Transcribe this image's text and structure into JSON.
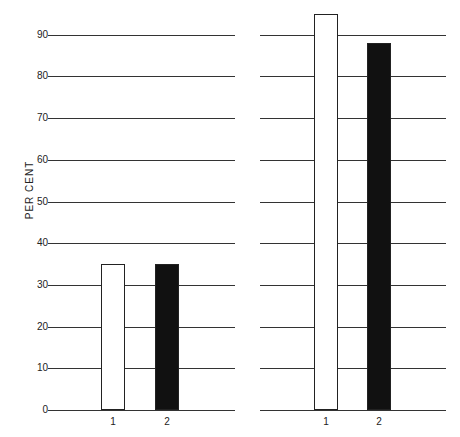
{
  "chart_data": [
    {
      "type": "bar",
      "panel": "left",
      "categories": [
        "1",
        "2"
      ],
      "values": [
        35,
        35
      ],
      "bar_fills": [
        "#ffffff",
        "#111111"
      ],
      "title": "",
      "xlabel": "",
      "ylabel": "PER CENT",
      "ylim": [
        0,
        95
      ],
      "yticks": [
        0,
        10,
        20,
        30,
        40,
        50,
        60,
        70,
        80,
        90
      ],
      "grid": true
    },
    {
      "type": "bar",
      "panel": "right",
      "categories": [
        "1",
        "2"
      ],
      "values": [
        95,
        88
      ],
      "bar_fills": [
        "#ffffff",
        "#111111"
      ],
      "title": "",
      "xlabel": "",
      "ylabel": "",
      "ylim": [
        0,
        95
      ],
      "yticks": [
        0,
        10,
        20,
        30,
        40,
        50,
        60,
        70,
        80,
        90
      ],
      "grid": true
    }
  ],
  "axis": {
    "ylabel": "PER CENT",
    "ticks": [
      "0",
      "10",
      "20",
      "30",
      "40",
      "50",
      "60",
      "70",
      "80",
      "90"
    ]
  },
  "left": {
    "x_labels": [
      "1",
      "2"
    ]
  },
  "right": {
    "x_labels": [
      "1",
      "2"
    ]
  }
}
